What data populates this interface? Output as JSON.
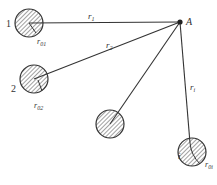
{
  "diagram": {
    "point": {
      "label": "A",
      "x": 180,
      "y": 22
    },
    "sources": [
      {
        "id": "1",
        "label": "1",
        "cx": 29,
        "cy": 23,
        "r": 14,
        "distance_label": "r",
        "distance_sub": "1",
        "radius_label": "r",
        "radius_sub": "01"
      },
      {
        "id": "2",
        "label": "2",
        "cx": 34,
        "cy": 79,
        "r": 14,
        "distance_label": "r",
        "distance_sub": "2",
        "radius_label": "r",
        "radius_sub": "02"
      },
      {
        "id": "3",
        "label": "",
        "cx": 110,
        "cy": 124,
        "r": 14
      },
      {
        "id": "i",
        "label": "i",
        "cx": 205,
        "cy": 152,
        "r": 14,
        "distance_label": "r",
        "distance_sub": "i",
        "radius_label": "r",
        "radius_sub": "0i"
      }
    ],
    "colors": {
      "stroke": "#333333",
      "hatch": "#444444",
      "background": "#ffffff"
    }
  }
}
